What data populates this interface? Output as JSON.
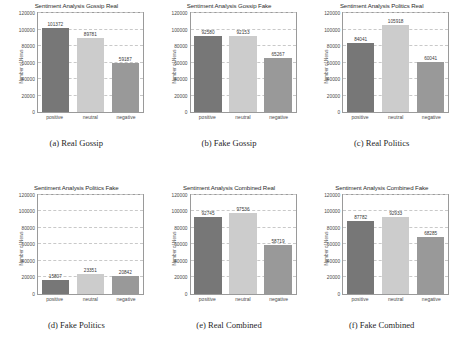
{
  "figure": {
    "ylabel": "Number of News",
    "categories": [
      "positive",
      "neutral",
      "negative"
    ],
    "yticks": [
      "0",
      "20000",
      "40000",
      "60000",
      "80000",
      "100000",
      "120000"
    ],
    "ymax": 120000,
    "colors": {
      "positive": "#777777",
      "neutral": "#cccccc",
      "negative": "#999999",
      "axis": "#9a9a9a",
      "grid": "#c9c9c9",
      "text": "#3a3a3a"
    }
  },
  "chart_data": [
    {
      "type": "bar",
      "id": "a",
      "title": "Sentiment Analysis Gossip Real",
      "caption": "(a) Real Gossip",
      "categories": [
        "positive",
        "neutral",
        "negative"
      ],
      "values": [
        101372,
        89781,
        59187
      ],
      "xlabel": "",
      "ylabel": "Number of News",
      "ylim": [
        0,
        120000
      ],
      "grid": true,
      "legend": "none"
    },
    {
      "type": "bar",
      "id": "b",
      "title": "Sentiment Analysis Gossip Fake",
      "caption": "(b) Fake Gossip",
      "categories": [
        "positive",
        "neutral",
        "negative"
      ],
      "values": [
        92580,
        92153,
        65267
      ],
      "xlabel": "",
      "ylabel": "Number of News",
      "ylim": [
        0,
        120000
      ],
      "grid": true,
      "legend": "none"
    },
    {
      "type": "bar",
      "id": "c",
      "title": "Sentiment Analysis Politics Real",
      "caption": "(c) Real Politics",
      "categories": [
        "positive",
        "neutral",
        "negative"
      ],
      "values": [
        84041,
        105918,
        60041
      ],
      "xlabel": "",
      "ylabel": "Number of News",
      "ylim": [
        0,
        120000
      ],
      "grid": true,
      "legend": "none"
    },
    {
      "type": "bar",
      "id": "d",
      "title": "Sentiment Analysis Politics Fake",
      "caption": "(d) Fake Politics",
      "categories": [
        "positive",
        "neutral",
        "negative"
      ],
      "values": [
        15807,
        23351,
        20842
      ],
      "xlabel": "",
      "ylabel": "Number of News",
      "ylim": [
        0,
        120000
      ],
      "grid": true,
      "legend": "none"
    },
    {
      "type": "bar",
      "id": "e",
      "title": "Sentiment Analysis Combined Real",
      "caption": "(e) Real Combined",
      "categories": [
        "positive",
        "neutral",
        "negative"
      ],
      "values": [
        92745,
        97536,
        58719
      ],
      "xlabel": "",
      "ylabel": "Number of News",
      "ylim": [
        0,
        120000
      ],
      "grid": true,
      "legend": "none"
    },
    {
      "type": "bar",
      "id": "f",
      "title": "Sentiment Analysis Combined Fake",
      "caption": "(f) Fake Combined",
      "categories": [
        "positive",
        "neutral",
        "negative"
      ],
      "values": [
        87782,
        92933,
        68285
      ],
      "xlabel": "",
      "ylabel": "Number of News",
      "ylim": [
        0,
        120000
      ],
      "grid": true,
      "legend": "none"
    }
  ]
}
